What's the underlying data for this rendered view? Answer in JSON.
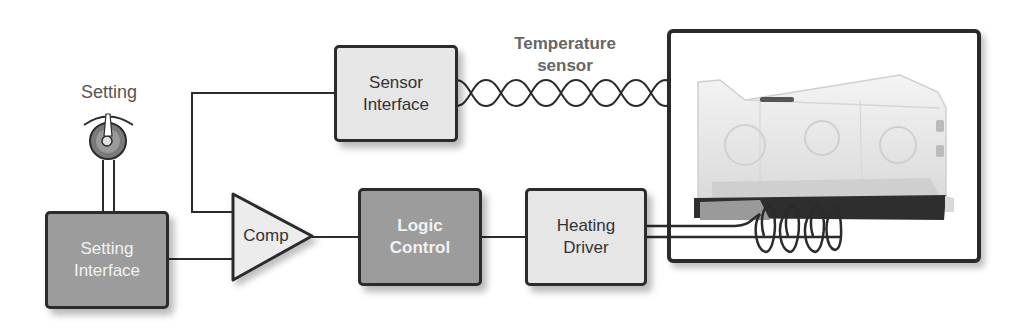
{
  "diagram": {
    "labels": {
      "setting": "Setting",
      "temperature_sensor_line1": "Temperature",
      "temperature_sensor_line2": "sensor"
    },
    "blocks": {
      "sensor_interface": {
        "line1": "Sensor",
        "line2": "Interface"
      },
      "setting_interface": {
        "line1": "Setting",
        "line2": "Interface"
      },
      "comparator": {
        "label": "Comp"
      },
      "logic_control": {
        "line1": "Logic",
        "line2": "Control"
      },
      "heating_driver": {
        "line1": "Heating",
        "line2": "Driver"
      }
    },
    "image": {
      "subject": "infant incubator"
    },
    "colors": {
      "line": "#2b2b2b",
      "light_block": "#e6e6e6",
      "dark_block": "#9c9c9c",
      "knob": "#7a7a7a"
    }
  }
}
